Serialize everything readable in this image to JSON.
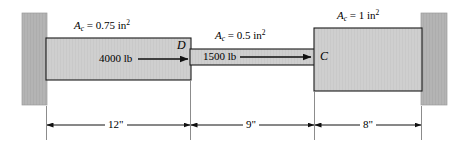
{
  "figure": {
    "type": "engineering-statics-diagram",
    "colors": {
      "wall_fill": "#b4b4b4",
      "bar_fill": "#cfcfcf",
      "outline": "#1a1a1a",
      "dimension_line": "#1a1a1a",
      "background": "#ffffff"
    },
    "area_labels": [
      {
        "id": "segment-ad",
        "var": "A",
        "sub": "c",
        "eq": "=",
        "value": "0.75",
        "unit": "in",
        "exp": "2"
      },
      {
        "id": "segment-dc",
        "var": "A",
        "sub": "c",
        "eq": "=",
        "value": "0.5",
        "unit": "in",
        "exp": "2"
      },
      {
        "id": "segment-cb",
        "var": "A",
        "sub": "c",
        "eq": "=",
        "value": "1",
        "unit": "in",
        "exp": "2"
      }
    ],
    "forces": [
      {
        "id": "force-at-d",
        "label": "4000 lb",
        "direction": "right",
        "applied_at": "D"
      },
      {
        "id": "force-at-c",
        "label": "1500 lb",
        "direction": "right",
        "applied_at": "C"
      }
    ],
    "nodes": [
      {
        "id": "node-d",
        "label": "D"
      },
      {
        "id": "node-c",
        "label": "C"
      }
    ],
    "dimensions": [
      {
        "id": "dim-left",
        "label": "12\"",
        "span": "wall-to-D"
      },
      {
        "id": "dim-middle",
        "label": "9\"",
        "span": "D-to-C"
      },
      {
        "id": "dim-right",
        "label": "8\"",
        "span": "C-to-wall"
      }
    ]
  }
}
